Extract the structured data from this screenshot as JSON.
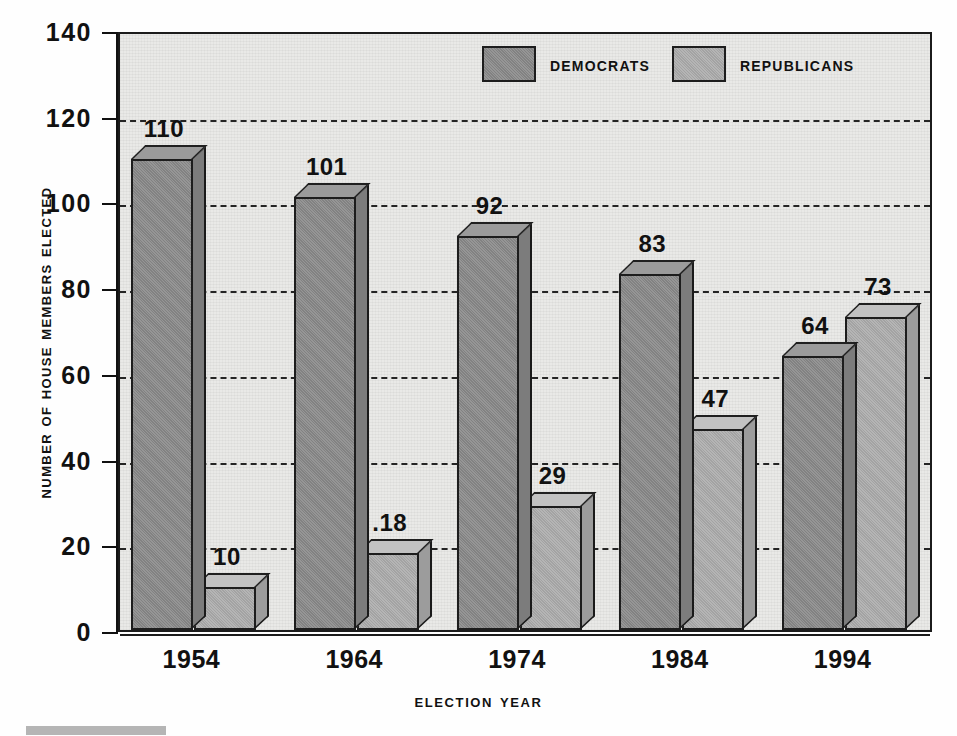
{
  "chart_data": {
    "type": "bar",
    "title": "",
    "subtitle": "",
    "xlabel": "Election Year",
    "ylabel": "Number of House Members Elected",
    "categories": [
      "1954",
      "1964",
      "1974",
      "1984",
      "1994"
    ],
    "series": [
      {
        "name": "Democrats",
        "values": [
          110,
          101,
          92,
          83,
          64
        ],
        "color": "#8a8a8a"
      },
      {
        "name": "Republicans",
        "values": [
          10,
          18,
          29,
          47,
          73
        ],
        "color": "#adadad"
      }
    ],
    "ylim": [
      0,
      140
    ],
    "ytick_values": [
      0,
      20,
      40,
      60,
      80,
      100,
      120,
      140
    ],
    "ytick_labels": [
      "0",
      "20",
      "40",
      "60",
      "80",
      "100",
      "120",
      "140"
    ],
    "grid": true,
    "grid_style": "dashed-horizontal",
    "legend_position": "top-center",
    "data_labels": [
      {
        "category": "1954",
        "series": "Democrats",
        "value": 110,
        "text": "110"
      },
      {
        "category": "1954",
        "series": "Republicans",
        "value": 10,
        "text": "10"
      },
      {
        "category": "1964",
        "series": "Democrats",
        "value": 101,
        "text": "101"
      },
      {
        "category": "1964",
        "series": "Republicans",
        "value": 18,
        "text": ".18"
      },
      {
        "category": "1974",
        "series": "Democrats",
        "value": 92,
        "text": "92"
      },
      {
        "category": "1974",
        "series": "Republicans",
        "value": 29,
        "text": "29"
      },
      {
        "category": "1984",
        "series": "Democrats",
        "value": 83,
        "text": "83"
      },
      {
        "category": "1984",
        "series": "Republicans",
        "value": 47,
        "text": "47"
      },
      {
        "category": "1994",
        "series": "Democrats",
        "value": 64,
        "text": "64"
      },
      {
        "category": "1994",
        "series": "Republicans",
        "value": 73,
        "text": "73"
      }
    ]
  },
  "axes": {
    "y_title": "Number of House Members Elected",
    "x_title": "Election Year",
    "y_ticks": [
      "140",
      "120",
      "100",
      "80",
      "60",
      "40",
      "20",
      "0"
    ],
    "x_ticks": [
      "1954",
      "1964",
      "1974",
      "1984",
      "1994"
    ]
  },
  "legend": {
    "items": [
      {
        "label": "Democrats",
        "color": "#8a8a8a"
      },
      {
        "label": "Republicans",
        "color": "#adadad"
      }
    ]
  },
  "colors": {
    "democrat_fill": "#8a8a8a",
    "republican_fill": "#adadad",
    "plot_background": "#e9e9e7",
    "axis_line": "#111111",
    "grid_line": "#242424",
    "text": "#111111"
  }
}
